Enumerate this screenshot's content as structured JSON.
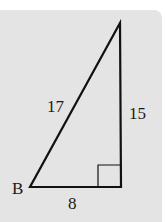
{
  "diagram": {
    "type": "right-triangle",
    "vertex_label": "B",
    "sides": {
      "hypotenuse": "17",
      "vertical_leg": "15",
      "horizontal_leg": "8"
    },
    "right_angle_marker": true,
    "colors": {
      "background": "#e4e4e4",
      "stroke": "#111111"
    }
  }
}
